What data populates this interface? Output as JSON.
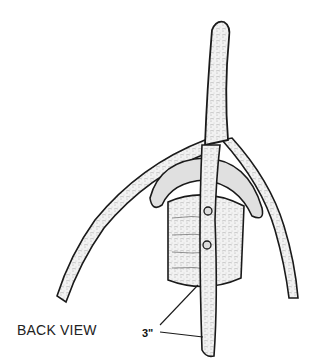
{
  "illustration": {
    "subject": "forked-branch-with-block",
    "view_label": "BACK VIEW",
    "dimension_label": "3\"",
    "colors": {
      "line": "#1a1a1a",
      "fill": "#f4f4f4",
      "shade": "#cfcfcf",
      "background": "#ffffff"
    }
  }
}
